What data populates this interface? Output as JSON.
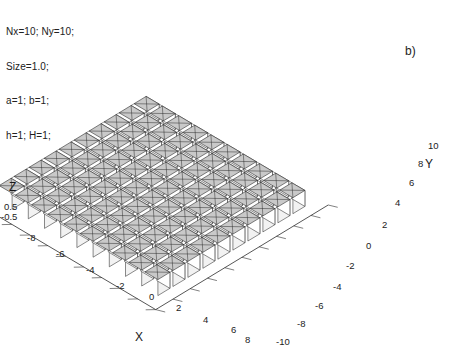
{
  "figure": {
    "panel_label": "b)",
    "annotation_lines": [
      "Nx=10; Ny=10;",
      "Size=1.0;",
      "a=1; b=1;",
      "h=1; H=1;"
    ]
  },
  "chart_data": {
    "type": "surface3d",
    "title": "",
    "subtitle": "",
    "xlabel": "X",
    "ylabel": "Y",
    "zlabel": "Z",
    "xlim": [
      -9,
      9
    ],
    "ylim": [
      -11,
      11
    ],
    "zlim": [
      -0.5,
      0.5
    ],
    "xticks": [
      -8,
      -6,
      -4,
      -2,
      0,
      2,
      4,
      6,
      8
    ],
    "yticks": [
      -10,
      -8,
      -6,
      -4,
      -2,
      0,
      2,
      4,
      6,
      8,
      10
    ],
    "zticks": [
      -0.5,
      0.5
    ],
    "xticklabels": [
      "-8",
      "-6",
      "-4",
      "-2",
      "0",
      "2",
      "4",
      "6",
      "8"
    ],
    "yticklabels": [
      "-10",
      "-8",
      "-6",
      "-4",
      "-2",
      "0",
      "2",
      "4",
      "6",
      "8",
      "10"
    ],
    "zticklabels": [
      "-0.5",
      "0.5"
    ],
    "grid": false,
    "legend": false,
    "projection": "isometric",
    "parameters": {
      "Nx": 10,
      "Ny": 10,
      "Size": 1.0,
      "a": 1,
      "b": 1,
      "h": 1,
      "H": 1
    },
    "face_color": "#c9c9c9",
    "edge_color": "#2b2b2b",
    "side_color": "#f2f2f2",
    "background": "#ffffff"
  },
  "axes": {
    "z_ticks": [
      {
        "label": "0.5",
        "x": 4,
        "y": 201
      },
      {
        "label": "-0.5",
        "x": 1,
        "y": 211
      }
    ],
    "x_ticks": [
      {
        "label": "-8",
        "x": 27,
        "y": 232
      },
      {
        "label": "-6",
        "x": 56,
        "y": 248
      },
      {
        "label": "-4",
        "x": 86,
        "y": 264
      },
      {
        "label": "-2",
        "x": 116,
        "y": 280
      },
      {
        "label": "0",
        "x": 149,
        "y": 291
      },
      {
        "label": "2",
        "x": 176,
        "y": 302
      },
      {
        "label": "4",
        "x": 203,
        "y": 314
      },
      {
        "label": "6",
        "x": 231,
        "y": 324
      },
      {
        "label": "8",
        "x": 245,
        "y": 334
      }
    ],
    "y_ticks": [
      {
        "label": "10",
        "x": 428,
        "y": 140
      },
      {
        "label": "8",
        "x": 418,
        "y": 158
      },
      {
        "label": "6",
        "x": 409,
        "y": 177
      },
      {
        "label": "4",
        "x": 395,
        "y": 197
      },
      {
        "label": "2",
        "x": 382,
        "y": 219
      },
      {
        "label": "0",
        "x": 366,
        "y": 240
      },
      {
        "label": "-2",
        "x": 346,
        "y": 260
      },
      {
        "label": "-4",
        "x": 333,
        "y": 281
      },
      {
        "label": "-6",
        "x": 315,
        "y": 300
      },
      {
        "label": "-8",
        "x": 297,
        "y": 318
      },
      {
        "label": "-10",
        "x": 276,
        "y": 336
      }
    ]
  }
}
